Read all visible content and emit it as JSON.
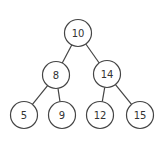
{
  "diagram": {
    "type": "binary-search-tree",
    "nodes": [
      {
        "id": "n10",
        "label": "10",
        "x": 78,
        "y": 33
      },
      {
        "id": "n8",
        "label": "8",
        "x": 56,
        "y": 75
      },
      {
        "id": "n14",
        "label": "14",
        "x": 107,
        "y": 74
      },
      {
        "id": "n5",
        "label": "5",
        "x": 24,
        "y": 115
      },
      {
        "id": "n9",
        "label": "9",
        "x": 62,
        "y": 115
      },
      {
        "id": "n12",
        "label": "12",
        "x": 100,
        "y": 115
      },
      {
        "id": "n15",
        "label": "15",
        "x": 140,
        "y": 115
      }
    ],
    "edges": [
      {
        "from": "n10",
        "to": "n8"
      },
      {
        "from": "n10",
        "to": "n14"
      },
      {
        "from": "n8",
        "to": "n5"
      },
      {
        "from": "n8",
        "to": "n9"
      },
      {
        "from": "n14",
        "to": "n12"
      },
      {
        "from": "n14",
        "to": "n15"
      }
    ],
    "node_radius": 13.5
  }
}
